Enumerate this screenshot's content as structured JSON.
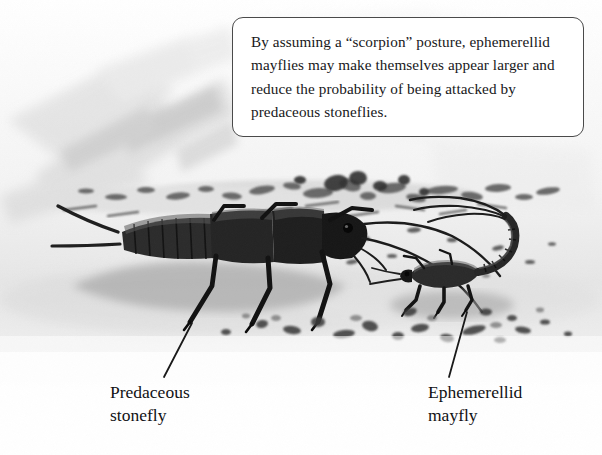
{
  "figure": {
    "width": 602,
    "height": 455,
    "background_color": "#ffffff",
    "scene_description": "Grayscale ink-wash illustration of a stream bottom with gravel, showing a large predaceous stonefly nymph at left and a smaller ephemerellid mayfly nymph at right raising its abdomen in a scorpion posture"
  },
  "callout": {
    "text": "By assuming a “scorpion” posture, ephemerellid mayflies may make themselves appear larger and reduce the probability of being attacked by predaceous stoneflies.",
    "border_color": "#4a4a4a",
    "fill_color": "#ffffff"
  },
  "labels": {
    "stonefly": "Predaceous\nstonefly",
    "mayfly": "Ephemerellid\nmayfly"
  },
  "leader_lines": [
    {
      "name": "stonefly-leader",
      "from_x": 192,
      "from_y": 323,
      "to_x": 164,
      "to_y": 377,
      "color": "#1a1a1a"
    },
    {
      "name": "mayfly-leader",
      "from_x": 467,
      "from_y": 312,
      "to_x": 449,
      "to_y": 377,
      "color": "#1a1a1a"
    }
  ],
  "palette": {
    "paper": "#ffffff",
    "wash_light": "#e9e9e9",
    "wash_mid": "#cfcfcf",
    "wash_dark": "#a8a8a8",
    "gravel": "#6d6d6d",
    "insect_body": "#2a2a2a",
    "insect_dark": "#141414",
    "shadow": "#9a9a9a",
    "text": "#111114"
  },
  "subjects": [
    {
      "name": "predaceous-stonefly",
      "position": "left-center",
      "size": "large",
      "features": [
        "segmented abdomen",
        "two cerci",
        "six legs",
        "two long antennae",
        "dark brown-black body"
      ]
    },
    {
      "name": "ephemerellid-mayfly",
      "position": "right-center",
      "size": "small",
      "features": [
        "abdomen curled up and forward over body",
        "scorpion posture",
        "three tails",
        "six legs",
        "antennae"
      ]
    }
  ]
}
